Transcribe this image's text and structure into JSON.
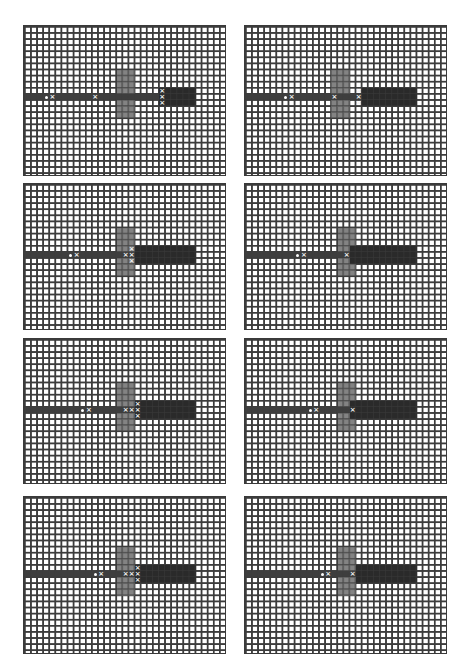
{
  "figure": {
    "cell_px": 6.1,
    "cols": 33,
    "rows": 25,
    "colors": {
      "grid_line": "#3c3c3c",
      "path": "#3e3e3e",
      "cross": "#6d6d6d",
      "block": "#2a2a2a",
      "marker": "#f2f2f2",
      "background": "#ffffff"
    },
    "panels": [
      {
        "id": 1,
        "x": 23,
        "y": 25,
        "w": 203,
        "h": 151,
        "path": {
          "row": 11,
          "col_start": 0,
          "col_end": 22
        },
        "cross": {
          "col_start": 15,
          "col_end": 17,
          "row_start": 7,
          "row_end": 14
        },
        "block": {
          "col_start": 22,
          "col_end": 27,
          "row_start": 10,
          "row_end": 12
        },
        "markers": [
          {
            "c": 3,
            "r": 11,
            "t": "dot"
          },
          {
            "c": 4,
            "r": 11,
            "t": "x"
          },
          {
            "c": 11,
            "r": 11,
            "t": "x"
          },
          {
            "c": 22,
            "r": 10,
            "t": "x"
          },
          {
            "c": 22,
            "r": 11,
            "t": "x"
          },
          {
            "c": 22,
            "r": 12,
            "t": "x"
          }
        ]
      },
      {
        "id": 2,
        "x": 244,
        "y": 25,
        "w": 203,
        "h": 151,
        "path": {
          "row": 11,
          "col_start": 0,
          "col_end": 19
        },
        "cross": {
          "col_start": 14,
          "col_end": 16,
          "row_start": 7,
          "row_end": 14
        },
        "block": {
          "col_start": 19,
          "col_end": 27,
          "row_start": 10,
          "row_end": 12
        },
        "markers": [
          {
            "c": 6,
            "r": 11,
            "t": "dot"
          },
          {
            "c": 7,
            "r": 11,
            "t": "x"
          },
          {
            "c": 14,
            "r": 11,
            "t": "x"
          },
          {
            "c": 18,
            "r": 10,
            "t": "x"
          },
          {
            "c": 18,
            "r": 11,
            "t": "x"
          },
          {
            "c": 18,
            "r": 12,
            "t": "x"
          }
        ]
      },
      {
        "id": 3,
        "x": 23,
        "y": 183,
        "w": 203,
        "h": 147,
        "path": {
          "row": 11,
          "col_start": 0,
          "col_end": 18
        },
        "cross": {
          "col_start": 15,
          "col_end": 17,
          "row_start": 7,
          "row_end": 14
        },
        "block": {
          "col_start": 18,
          "col_end": 27,
          "row_start": 10,
          "row_end": 12
        },
        "markers": [
          {
            "c": 7,
            "r": 11,
            "t": "dot"
          },
          {
            "c": 8,
            "r": 11,
            "t": "x"
          },
          {
            "c": 16,
            "r": 11,
            "t": "x"
          },
          {
            "c": 17,
            "r": 10,
            "t": "x"
          },
          {
            "c": 17,
            "r": 11,
            "t": "x"
          },
          {
            "c": 17,
            "r": 12,
            "t": "x"
          }
        ]
      },
      {
        "id": 4,
        "x": 244,
        "y": 183,
        "w": 203,
        "h": 147,
        "path": {
          "row": 11,
          "col_start": 0,
          "col_end": 17
        },
        "cross": {
          "col_start": 15,
          "col_end": 17,
          "row_start": 7,
          "row_end": 14
        },
        "block": {
          "col_start": 17,
          "col_end": 27,
          "row_start": 10,
          "row_end": 12
        },
        "markers": [
          {
            "c": 8,
            "r": 11,
            "t": "dot"
          },
          {
            "c": 9,
            "r": 11,
            "t": "x"
          },
          {
            "c": 16,
            "r": 11,
            "t": "x"
          }
        ]
      },
      {
        "id": 5,
        "x": 23,
        "y": 338,
        "w": 203,
        "h": 146,
        "path": {
          "row": 11,
          "col_start": 0,
          "col_end": 18
        },
        "cross": {
          "col_start": 15,
          "col_end": 17,
          "row_start": 7,
          "row_end": 14
        },
        "block": {
          "col_start": 18,
          "col_end": 27,
          "row_start": 10,
          "row_end": 12
        },
        "markers": [
          {
            "c": 9,
            "r": 11,
            "t": "dot"
          },
          {
            "c": 10,
            "r": 11,
            "t": "x"
          },
          {
            "c": 16,
            "r": 11,
            "t": "x"
          },
          {
            "c": 17,
            "r": 11,
            "t": "x"
          },
          {
            "c": 18,
            "r": 10,
            "t": "x"
          },
          {
            "c": 18,
            "r": 11,
            "t": "x"
          },
          {
            "c": 18,
            "r": 12,
            "t": "x"
          }
        ]
      },
      {
        "id": 6,
        "x": 244,
        "y": 338,
        "w": 203,
        "h": 146,
        "path": {
          "row": 11,
          "col_start": 0,
          "col_end": 17
        },
        "cross": {
          "col_start": 15,
          "col_end": 17,
          "row_start": 7,
          "row_end": 14
        },
        "block": {
          "col_start": 17,
          "col_end": 27,
          "row_start": 10,
          "row_end": 12
        },
        "markers": [
          {
            "c": 10,
            "r": 11,
            "t": "dot"
          },
          {
            "c": 11,
            "r": 11,
            "t": "x"
          },
          {
            "c": 17,
            "r": 11,
            "t": "x"
          }
        ]
      },
      {
        "id": 7,
        "x": 23,
        "y": 496,
        "w": 203,
        "h": 158,
        "path": {
          "row": 12,
          "col_start": 0,
          "col_end": 18
        },
        "cross": {
          "col_start": 15,
          "col_end": 17,
          "row_start": 8,
          "row_end": 15
        },
        "block": {
          "col_start": 18,
          "col_end": 27,
          "row_start": 11,
          "row_end": 13
        },
        "markers": [
          {
            "c": 11,
            "r": 12,
            "t": "dot"
          },
          {
            "c": 12,
            "r": 12,
            "t": "x"
          },
          {
            "c": 16,
            "r": 12,
            "t": "x"
          },
          {
            "c": 17,
            "r": 12,
            "t": "x"
          },
          {
            "c": 18,
            "r": 11,
            "t": "x"
          },
          {
            "c": 18,
            "r": 12,
            "t": "x"
          },
          {
            "c": 18,
            "r": 13,
            "t": "x"
          }
        ]
      },
      {
        "id": 8,
        "x": 244,
        "y": 496,
        "w": 203,
        "h": 158,
        "path": {
          "row": 12,
          "col_start": 0,
          "col_end": 18
        },
        "cross": {
          "col_start": 15,
          "col_end": 17,
          "row_start": 8,
          "row_end": 15
        },
        "block": {
          "col_start": 18,
          "col_end": 27,
          "row_start": 11,
          "row_end": 13
        },
        "markers": [
          {
            "c": 12,
            "r": 12,
            "t": "dot"
          },
          {
            "c": 13,
            "r": 12,
            "t": "x"
          },
          {
            "c": 17,
            "r": 12,
            "t": "x"
          }
        ]
      }
    ],
    "marker_glyphs": {
      "x": "×",
      "dot": ""
    }
  }
}
